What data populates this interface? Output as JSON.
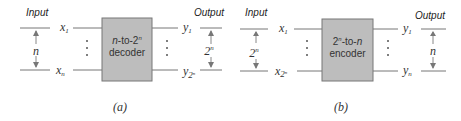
{
  "panels": [
    {
      "id": "a",
      "caption": "(a)",
      "input_label": "Input",
      "output_label": "Output",
      "block": {
        "line1": "n-to-2",
        "line1_sup": "n",
        "line2": "decoder"
      },
      "inputs": {
        "first": "x",
        "first_sub": "1",
        "last": "x",
        "last_sub": "n"
      },
      "outputs": {
        "first": "y",
        "first_sub": "1",
        "last": "y",
        "last_sub": "2",
        "last_sub_sup": "n"
      },
      "input_width": {
        "base": "n",
        "sup": ""
      },
      "output_width": {
        "base": "2",
        "sup": "n"
      }
    },
    {
      "id": "b",
      "caption": "(b)",
      "input_label": "Input",
      "output_label": "Output",
      "block": {
        "line1_pre": "2",
        "line1_sup": "n",
        "line1_post": "-to-n",
        "line2": "encoder"
      },
      "inputs": {
        "first": "x",
        "first_sub": "1",
        "last": "x",
        "last_sub": "2",
        "last_sub_sup": "n"
      },
      "outputs": {
        "first": "y",
        "first_sub": "1",
        "last": "y",
        "last_sub": "n"
      },
      "input_width": {
        "base": "2",
        "sup": "n"
      },
      "output_width": {
        "base": "n",
        "sup": ""
      }
    }
  ],
  "colors": {
    "block_fill": "#bdbdbd",
    "line": "#777777",
    "text": "#333333"
  }
}
